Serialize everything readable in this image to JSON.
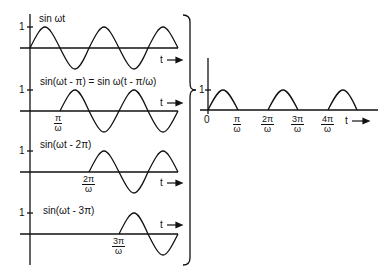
{
  "left_panels": [
    {
      "label": "sin ωt",
      "one_tick": "1",
      "start_marker": null,
      "t_label": "t"
    },
    {
      "label": "sin(ωt - π) = sin ω(t - π/ω)",
      "one_tick": "1",
      "start_marker": {
        "num": "π",
        "den": "ω"
      },
      "t_label": "t"
    },
    {
      "label": "sin(ωt - 2π)",
      "one_tick": "1",
      "start_marker": {
        "num": "2π",
        "den": "ω"
      },
      "t_label": "t"
    },
    {
      "label": "sin(ωt - 3π)",
      "one_tick": "1",
      "start_marker": {
        "num": "3π",
        "den": "ω"
      },
      "t_label": "t"
    }
  ],
  "right_panel": {
    "one_tick": "1",
    "origin": "0",
    "ticks": [
      {
        "num": "π",
        "den": "ω"
      },
      {
        "num": "2π",
        "den": "ω"
      },
      {
        "num": "3π",
        "den": "ω"
      },
      {
        "num": "4π",
        "den": "ω"
      }
    ],
    "t_label": "t"
  },
  "brace": "right-brace-sum",
  "colors": {
    "ink": "#111111",
    "background": "#ffffff"
  }
}
